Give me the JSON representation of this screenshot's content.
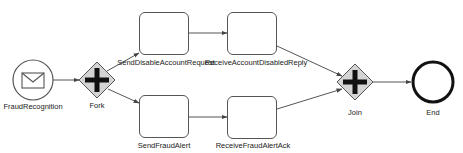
{
  "diagram": {
    "type": "BPMN process",
    "colors": {
      "stroke": "#555555",
      "gateway_fill": "#d4d4d4",
      "gateway_symbol": "#111111",
      "end_stroke": "#111111",
      "background": "#ffffff"
    },
    "nodes": {
      "start": {
        "label": "FraudRecognition",
        "kind": "message-start-event",
        "icon": "envelope-icon"
      },
      "fork": {
        "label": "Fork",
        "kind": "parallel-gateway",
        "icon": "plus-icon"
      },
      "task1": {
        "label": "SendDisableAccountRequest",
        "kind": "task"
      },
      "task2": {
        "label": "ReceiveAccountDisabledReply",
        "kind": "task"
      },
      "task3": {
        "label": "SendFraudAlert",
        "kind": "task"
      },
      "task4": {
        "label": "ReceiveFraudAlertAck",
        "kind": "task"
      },
      "join": {
        "label": "Join",
        "kind": "parallel-gateway",
        "icon": "plus-icon"
      },
      "end": {
        "label": "End",
        "kind": "end-event"
      }
    },
    "edges": [
      {
        "from": "FraudRecognition",
        "to": "Fork"
      },
      {
        "from": "Fork",
        "to": "SendDisableAccountRequest"
      },
      {
        "from": "Fork",
        "to": "SendFraudAlert"
      },
      {
        "from": "SendDisableAccountRequest",
        "to": "ReceiveAccountDisabledReply"
      },
      {
        "from": "SendFraudAlert",
        "to": "ReceiveFraudAlertAck"
      },
      {
        "from": "ReceiveAccountDisabledReply",
        "to": "Join"
      },
      {
        "from": "ReceiveFraudAlertAck",
        "to": "Join"
      },
      {
        "from": "Join",
        "to": "End"
      }
    ]
  }
}
